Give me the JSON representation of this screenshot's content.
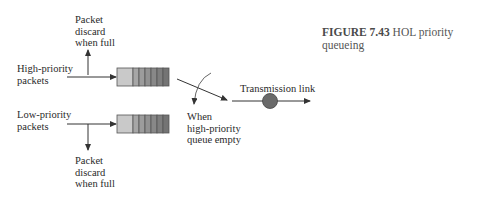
{
  "caption": {
    "figure_number": "FIGURE 7.43",
    "title_line1": "HOL priority",
    "title_line2": "queueing"
  },
  "labels": {
    "high_input": [
      "High-priority",
      "packets"
    ],
    "low_input": [
      "Low-priority",
      "packets"
    ],
    "top_discard": [
      "Packet",
      "discard",
      "when full"
    ],
    "bottom_discard": [
      "Packet",
      "discard",
      "when full"
    ],
    "condition": [
      "When",
      "high-priority",
      "queue empty"
    ],
    "output": "Transmission link"
  },
  "queues": {
    "high": {
      "cells": 7,
      "colors": [
        "#c9c9c9",
        "#a6a6a6",
        "#9c9c9c",
        "#929292",
        "#888888",
        "#7e7e7e",
        "#747474"
      ]
    },
    "low": {
      "cells": 7,
      "colors": [
        "#c9c9c9",
        "#a6a6a6",
        "#9c9c9c",
        "#929292",
        "#888888",
        "#7e7e7e",
        "#747474"
      ]
    }
  },
  "colors": {
    "line": "#333333",
    "server": "#6a6a6a",
    "queue_border": "#555555"
  }
}
